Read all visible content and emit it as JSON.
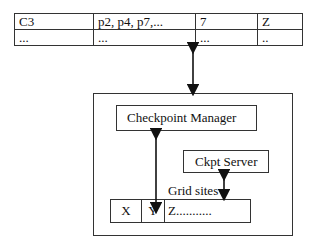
{
  "table": {
    "rows": [
      [
        "C3",
        "p2, p4, p7,...",
        "7",
        "Z"
      ],
      [
        "...",
        "...",
        "...",
        ".."
      ]
    ],
    "column_widths": [
      78,
      101,
      61,
      45
    ]
  },
  "outer_box": {},
  "checkpoint_manager": {
    "label": "Checkpoint Manager"
  },
  "ckpt_server": {
    "label": "Ckpt Server"
  },
  "grid_sites": {
    "label": "Grid sites",
    "cells": [
      "X",
      "Y",
      "Z..........."
    ]
  },
  "colors": {
    "line": "#333333",
    "background": "#ffffff",
    "bleed_text": "#e4e4e4"
  }
}
